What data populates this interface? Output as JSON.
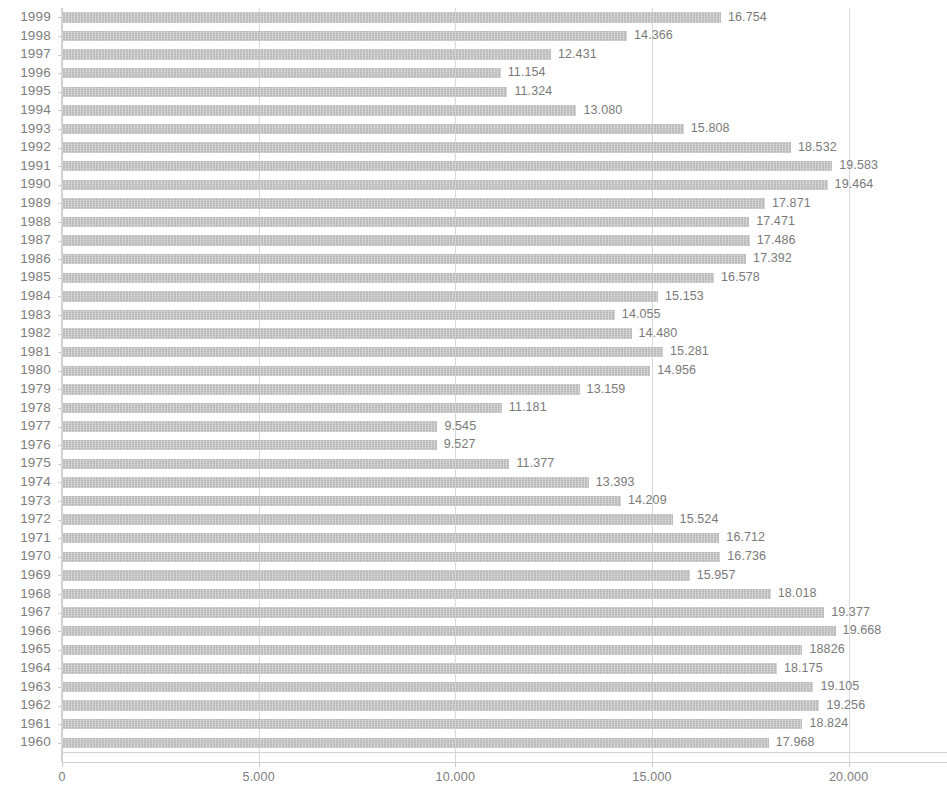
{
  "chart_data": {
    "type": "bar",
    "orientation": "horizontal",
    "title": "",
    "xlabel": "",
    "ylabel": "",
    "xlim": [
      0,
      22500
    ],
    "grid": true,
    "legend": null,
    "xticks": [
      "0",
      "5.000",
      "10.000",
      "15.000",
      "20.000"
    ],
    "xtick_values": [
      0,
      5000,
      10000,
      15000,
      20000
    ],
    "categories": [
      "1999",
      "1998",
      "1997",
      "1996",
      "1995",
      "1994",
      "1993",
      "1992",
      "1991",
      "1990",
      "1989",
      "1988",
      "1987",
      "1986",
      "1985",
      "1984",
      "1983",
      "1982",
      "1981",
      "1980",
      "1979",
      "1978",
      "1977",
      "1976",
      "1975",
      "1974",
      "1973",
      "1972",
      "1971",
      "1970",
      "1969",
      "1968",
      "1967",
      "1966",
      "1965",
      "1964",
      "1963",
      "1962",
      "1961",
      "1960"
    ],
    "values": [
      16754,
      14366,
      12431,
      11154,
      11324,
      13080,
      15808,
      18532,
      19583,
      19464,
      17871,
      17471,
      17486,
      17392,
      16578,
      15153,
      14055,
      14480,
      15281,
      14956,
      13159,
      11181,
      9545,
      9527,
      11377,
      13393,
      14209,
      15524,
      16712,
      16736,
      15957,
      18018,
      19377,
      19668,
      18826,
      18175,
      19105,
      19256,
      18824,
      17968
    ],
    "value_labels": [
      "16.754",
      "14.366",
      "12.431",
      "11.154",
      "11.324",
      "13.080",
      "15.808",
      "18.532",
      "19.583",
      "19.464",
      "17.871",
      "17.471",
      "17.486",
      "17.392",
      "16.578",
      "15.153",
      "14.055",
      "14.480",
      "15.281",
      "14.956",
      "13.159",
      "11.181",
      "9.545",
      "9.527",
      "11.377",
      "13.393",
      "14.209",
      "15.524",
      "16.712",
      "16.736",
      "15.957",
      "18.018",
      "19.377",
      "19.668",
      "18826",
      "18.175",
      "19.105",
      "19.256",
      "18.824",
      "17.968"
    ],
    "bar_color": "#b9b9b9",
    "grid_color": "#d9d9d9",
    "text_color": "#7a7a7a"
  },
  "title_remnant": ""
}
